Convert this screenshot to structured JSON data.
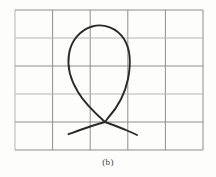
{
  "figure": {
    "caption": "(b)",
    "background_color": "#fdfdfc",
    "panel_label": "b",
    "grid": {
      "name": "square-grid",
      "columns": 5,
      "rows": 5,
      "x_start": 15,
      "y_start": 10,
      "x_end": 203,
      "y_end": 150,
      "cell_width": 37.6,
      "cell_height": 28.0,
      "line_color": "#8d8d8b",
      "line_color_light": "#b5b5b2",
      "line_width": 1.0,
      "x_lines": [
        15,
        52.6,
        90.2,
        127.8,
        165.4,
        203
      ],
      "y_lines": [
        10,
        38,
        66,
        94,
        122,
        150
      ]
    },
    "drawing": {
      "name": "looped-curve",
      "stroke_color": "#2a2a28",
      "stroke_width": 1.9,
      "crossing_point": [
        105,
        122
      ],
      "loop_top": [
        96,
        26
      ],
      "loop_left": [
        70,
        66
      ],
      "loop_right": [
        125,
        62
      ],
      "left_tail_end": [
        68,
        134
      ],
      "right_tail_end": [
        137,
        135
      ],
      "loop_path": "M 105 122 C 96 114 85 104 78 92 C 70 79 67 66 69 54 C 71 41 80 30 92 26.5 C 104 23 117 28 124 39 C 131 50 131 64 128 79 C 125 94 117 108 108 118 C 106.5 119.8 105.8 121 105 122 Z",
      "left_tail_path": "M 105 122 C 98 124 88 127 80 130 C 75 132 71 133.2 68.5 134.2",
      "right_tail_path": "M 105 122 C 112 124.5 120 127.5 127 130.5 C 132 132.6 135 134 137 135"
    }
  }
}
